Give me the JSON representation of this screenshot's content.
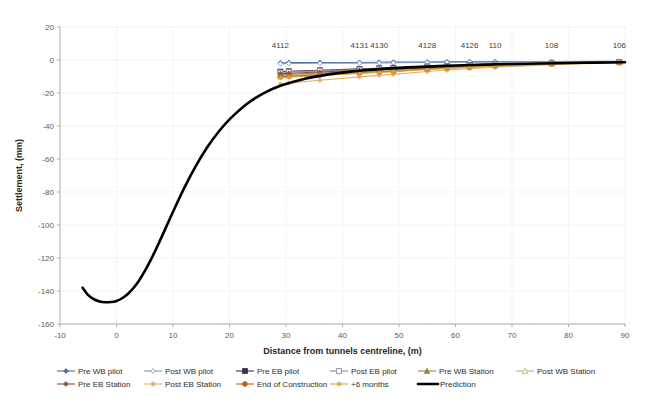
{
  "chart_data": {
    "type": "line",
    "title": "",
    "xlabel": "Distance from tunnels centreline, (m)",
    "ylabel": "Settlement, (mm)",
    "xlim": [
      -10,
      90
    ],
    "ylim": [
      -160,
      20
    ],
    "xticks": [
      -10,
      0,
      10,
      20,
      30,
      40,
      50,
      60,
      70,
      80,
      90
    ],
    "yticks": [
      20,
      0,
      -20,
      -40,
      -60,
      -80,
      -100,
      -120,
      -140,
      -160
    ],
    "grid": true,
    "legend_position": "bottom",
    "point_labels": [
      {
        "text": "4112",
        "x": 29,
        "y": 0
      },
      {
        "text": "4131",
        "x": 43,
        "y": 0
      },
      {
        "text": "4130",
        "x": 46.5,
        "y": 0
      },
      {
        "text": "4128",
        "x": 55,
        "y": 0
      },
      {
        "text": "4126",
        "x": 62.5,
        "y": 0
      },
      {
        "text": "110",
        "x": 67,
        "y": 0
      },
      {
        "text": "108",
        "x": 77,
        "y": 0
      },
      {
        "text": "106",
        "x": 89,
        "y": 0
      }
    ],
    "series": [
      {
        "name": "Pre WB pilot",
        "color": "#4a6f9c",
        "marker": "diamond-filled",
        "x": [
          29,
          30.5,
          36,
          43,
          46.5,
          49,
          55,
          58.5,
          62.5,
          67,
          77,
          89
        ],
        "values": [
          -1.8,
          -1.6,
          -1.5,
          -1.5,
          -1.4,
          -1.3,
          -1.2,
          -1.1,
          -1.0,
          -1.0,
          -0.9,
          -0.8
        ]
      },
      {
        "name": "Post WB pilot",
        "color": "#7e9cc0",
        "marker": "diamond-open",
        "x": [
          29,
          30.5,
          36,
          43,
          46.5,
          49,
          55,
          58.5,
          62.5,
          67,
          77,
          89
        ],
        "values": [
          -2.2,
          -2.1,
          -2.0,
          -1.9,
          -1.8,
          -1.7,
          -1.5,
          -1.4,
          -1.3,
          -1.2,
          -1.0,
          -0.9
        ]
      },
      {
        "name": "Pre EB pilot",
        "color": "#3b3355",
        "marker": "square-filled",
        "x": [
          29,
          30.5,
          36,
          43,
          46.5,
          49,
          55,
          58.5,
          62.5,
          67,
          77,
          89
        ],
        "values": [
          -7.0,
          -6.8,
          -6.2,
          -5.4,
          -5.0,
          -4.7,
          -3.9,
          -3.5,
          -3.0,
          -2.6,
          -1.8,
          -1.2
        ]
      },
      {
        "name": "Post EB pilot",
        "color": "#8f8aa8",
        "marker": "square-open",
        "x": [
          29,
          30.5,
          36,
          43,
          46.5,
          49,
          55,
          58.5,
          62.5,
          67,
          77,
          89
        ],
        "values": [
          -7.6,
          -7.3,
          -6.6,
          -5.8,
          -5.4,
          -5.1,
          -4.2,
          -3.7,
          -3.2,
          -2.8,
          -1.9,
          -1.3
        ]
      },
      {
        "name": "Pre WB Station",
        "color": "#9a8a3c",
        "marker": "triangle-filled",
        "x": [
          29,
          30.5,
          36,
          43,
          46.5,
          49,
          55,
          58.5,
          62.5,
          67,
          77,
          89
        ],
        "values": [
          -9.0,
          -8.7,
          -7.9,
          -6.8,
          -6.3,
          -5.9,
          -4.9,
          -4.3,
          -3.7,
          -3.2,
          -2.1,
          -1.4
        ]
      },
      {
        "name": "Post WB Station",
        "color": "#c3b66c",
        "marker": "triangle-open",
        "x": [
          29,
          30.5,
          36,
          43,
          46.5,
          49,
          55,
          58.5,
          62.5,
          67,
          77,
          89
        ],
        "values": [
          -9.6,
          -9.3,
          -8.4,
          -7.2,
          -6.7,
          -6.3,
          -5.2,
          -4.6,
          -3.9,
          -3.4,
          -2.2,
          -1.4
        ]
      },
      {
        "name": "Pre EB Station",
        "color": "#8c4b3a",
        "marker": "cross-filled",
        "x": [
          29,
          30.5,
          36,
          43,
          46.5,
          49,
          55,
          58.5,
          62.5,
          67,
          77,
          89
        ],
        "values": [
          -8.2,
          -8.0,
          -7.3,
          -6.3,
          -5.9,
          -5.5,
          -4.6,
          -4.1,
          -3.5,
          -3.0,
          -2.0,
          -1.3
        ]
      },
      {
        "name": "Post EB Station",
        "color": "#e0b06a",
        "marker": "cross-open",
        "x": [
          29,
          30.5,
          36,
          43,
          46.5,
          49,
          55,
          58.5,
          62.5,
          67,
          77,
          89
        ],
        "values": [
          -14.6,
          -14.0,
          -12.3,
          -10.2,
          -9.3,
          -8.7,
          -7.0,
          -6.1,
          -5.2,
          -4.4,
          -2.8,
          -1.7
        ]
      },
      {
        "name": "End of Construction",
        "color": "#b5651d",
        "marker": "circle-filled",
        "x": [
          29,
          30.5,
          36,
          43,
          46.5,
          49,
          55,
          58.5,
          62.5,
          67,
          77,
          89
        ],
        "values": [
          -10.2,
          -9.9,
          -9.0,
          -7.8,
          -7.2,
          -6.8,
          -5.6,
          -4.9,
          -4.2,
          -3.6,
          -2.3,
          -1.5
        ]
      },
      {
        "name": "+6 months",
        "color": "#d9a441",
        "marker": "star-filled",
        "x": [
          29,
          30.5,
          36,
          43,
          46.5,
          49,
          55,
          58.5,
          62.5,
          67,
          77,
          89
        ],
        "values": [
          -10.8,
          -10.4,
          -9.4,
          -8.1,
          -7.5,
          -7.1,
          -5.8,
          -5.1,
          -4.4,
          -3.8,
          -2.4,
          -1.5
        ]
      },
      {
        "name": "Prediction",
        "color": "#000000",
        "marker": "none",
        "thick": true,
        "x": [
          -6,
          -5,
          -4,
          -3,
          -2,
          -1,
          0,
          1,
          2,
          3,
          4,
          5,
          6,
          7,
          8,
          9,
          10,
          12,
          14,
          16,
          18,
          20,
          23,
          26,
          29,
          33,
          37,
          41,
          45,
          50,
          55,
          60,
          65,
          70,
          75,
          80,
          85,
          90
        ],
        "values": [
          -138.0,
          -142.5,
          -145.0,
          -146.3,
          -146.8,
          -146.7,
          -146.0,
          -144.4,
          -141.8,
          -138.2,
          -133.6,
          -128.0,
          -121.6,
          -114.6,
          -107.2,
          -99.6,
          -92.0,
          -77.5,
          -64.5,
          -53.2,
          -43.8,
          -36.0,
          -26.8,
          -20.2,
          -15.6,
          -11.6,
          -9.0,
          -7.2,
          -6.0,
          -4.8,
          -4.0,
          -3.3,
          -2.8,
          -2.4,
          -2.1,
          -1.8,
          -1.6,
          -1.4
        ]
      }
    ],
    "legend": [
      {
        "label": "Pre WB pilot",
        "color": "#4a6f9c",
        "marker": "diamond-filled"
      },
      {
        "label": "Post WB pilot",
        "color": "#7e9cc0",
        "marker": "diamond-open"
      },
      {
        "label": "Pre EB pilot",
        "color": "#3b3355",
        "marker": "square-filled"
      },
      {
        "label": "Post EB pilot",
        "color": "#8f8aa8",
        "marker": "square-open"
      },
      {
        "label": "Pre WB Station",
        "color": "#9a8a3c",
        "marker": "triangle-filled"
      },
      {
        "label": "Post WB Station",
        "color": "#c3b66c",
        "marker": "triangle-open"
      },
      {
        "label": "Pre EB Station",
        "color": "#8c4b3a",
        "marker": "cross-filled"
      },
      {
        "label": "Post EB Station",
        "color": "#e0b06a",
        "marker": "cross-open"
      },
      {
        "label": "End of Construction",
        "color": "#b5651d",
        "marker": "circle-filled"
      },
      {
        "label": "+6 months",
        "color": "#d9a441",
        "marker": "star-filled"
      },
      {
        "label": "Prediction",
        "color": "#000000",
        "marker": "none"
      }
    ]
  }
}
